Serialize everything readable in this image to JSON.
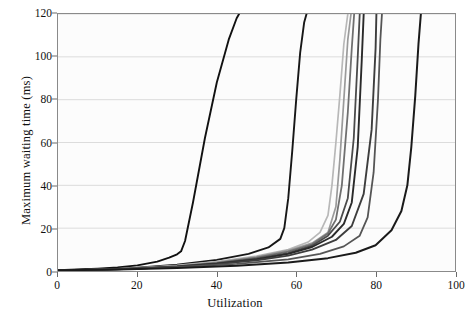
{
  "chart_data": {
    "type": "line",
    "title": "",
    "xlabel": "Utilization",
    "ylabel": "Maximum waiting time (ms)",
    "xlim": [
      0,
      100
    ],
    "ylim": [
      0,
      120
    ],
    "xticks": [
      0,
      20,
      40,
      60,
      80,
      100
    ],
    "yticks": [
      0,
      20,
      40,
      60,
      80,
      100,
      120
    ],
    "grid": "horizontal",
    "legend": "none",
    "background": "#fcfcfc",
    "gridcolor": "#d8d8d8",
    "framecolor": "#8a8a8a",
    "series": [
      {
        "name": "curve-1",
        "color": "#111111",
        "width": 1.9,
        "x": [
          0,
          5,
          10,
          15,
          20,
          25,
          28,
          30,
          31,
          32,
          34,
          37,
          40,
          43,
          45,
          45.6
        ],
        "y": [
          0.4,
          0.7,
          1.1,
          1.7,
          2.6,
          4.4,
          6.2,
          7.8,
          9.2,
          14,
          32,
          62,
          88,
          108,
          118,
          120
        ]
      },
      {
        "name": "curve-2",
        "color": "#171717",
        "width": 1.9,
        "x": [
          0,
          10,
          20,
          30,
          40,
          48,
          53,
          56,
          57,
          58,
          59,
          60,
          61,
          62,
          62.6
        ],
        "y": [
          0.3,
          0.8,
          1.6,
          3.0,
          5.2,
          8.0,
          11.0,
          15.0,
          20,
          34,
          56,
          80,
          102,
          116,
          120
        ]
      },
      {
        "name": "curve-3",
        "color": "#b8b8b8",
        "width": 1.7,
        "x": [
          0,
          10,
          20,
          30,
          40,
          50,
          58,
          63,
          66,
          68,
          69,
          70,
          71,
          72,
          73
        ],
        "y": [
          0.3,
          0.7,
          1.4,
          2.6,
          4.4,
          7.0,
          10.0,
          13.5,
          18.0,
          26,
          40,
          60,
          82,
          106,
          120
        ]
      },
      {
        "name": "curve-4",
        "color": "#9a9a9a",
        "width": 1.7,
        "x": [
          0,
          10,
          20,
          30,
          40,
          50,
          58,
          64,
          68,
          70,
          71,
          72,
          73,
          73.8
        ],
        "y": [
          0.3,
          0.7,
          1.3,
          2.4,
          4.1,
          6.6,
          9.6,
          13.0,
          18.0,
          30,
          52,
          80,
          108,
          120
        ]
      },
      {
        "name": "curve-5",
        "color": "#6f6f6f",
        "width": 1.8,
        "x": [
          0,
          10,
          20,
          30,
          40,
          50,
          58,
          64,
          68,
          70,
          71.5,
          73,
          74,
          74.6
        ],
        "y": [
          0.3,
          0.6,
          1.2,
          2.2,
          3.8,
          6.2,
          9.0,
          12.5,
          17.5,
          24,
          40,
          74,
          104,
          120
        ]
      },
      {
        "name": "curve-6",
        "color": "#4a4a4a",
        "width": 1.8,
        "x": [
          0,
          10,
          20,
          30,
          40,
          50,
          58,
          64,
          68,
          71,
          73,
          74.5,
          75.5,
          76
        ],
        "y": [
          0.3,
          0.6,
          1.2,
          2.1,
          3.6,
          5.8,
          8.4,
          11.8,
          16.5,
          23,
          34,
          62,
          100,
          120
        ]
      },
      {
        "name": "curve-7",
        "color": "#2a2a2a",
        "width": 1.9,
        "x": [
          0,
          10,
          20,
          30,
          40,
          50,
          58,
          64,
          69,
          72,
          74,
          75.5,
          76.5,
          77
        ],
        "y": [
          0.3,
          0.6,
          1.1,
          2.0,
          3.4,
          5.4,
          8.0,
          11.2,
          16.0,
          22,
          32,
          58,
          98,
          120
        ]
      },
      {
        "name": "curve-8",
        "color": "#3d3d3d",
        "width": 1.9,
        "x": [
          0,
          10,
          20,
          30,
          40,
          50,
          58,
          64,
          70,
          74,
          77,
          79,
          80,
          80.2
        ],
        "y": [
          0.3,
          0.6,
          1.1,
          1.9,
          3.2,
          5.0,
          7.2,
          10.0,
          14.5,
          21,
          36,
          66,
          104,
          120
        ]
      },
      {
        "name": "curve-9",
        "color": "#555555",
        "width": 1.8,
        "x": [
          0,
          15,
          30,
          45,
          58,
          66,
          72,
          76,
          78,
          79.5,
          80.6,
          81.2,
          81.6
        ],
        "y": [
          0.3,
          0.8,
          1.8,
          3.3,
          5.4,
          8.0,
          11.5,
          16.5,
          25,
          46,
          80,
          108,
          120
        ]
      },
      {
        "name": "curve-10",
        "color": "#1a1a1a",
        "width": 2.0,
        "x": [
          0,
          15,
          30,
          45,
          58,
          68,
          75,
          80,
          84,
          86.5,
          88,
          89,
          90,
          90.8,
          91.4
        ],
        "y": [
          0.3,
          0.7,
          1.4,
          2.5,
          4.0,
          6.0,
          8.5,
          12.0,
          19.0,
          28,
          40,
          58,
          82,
          106,
          120
        ]
      }
    ]
  },
  "axes": {
    "x_tick_labels": [
      "0",
      "20",
      "40",
      "60",
      "80",
      "100"
    ],
    "y_tick_labels": [
      "0",
      "20",
      "40",
      "60",
      "80",
      "100",
      "120"
    ],
    "x_axis_title": "Utilization",
    "y_axis_title": "Maximum waiting time (ms)"
  }
}
